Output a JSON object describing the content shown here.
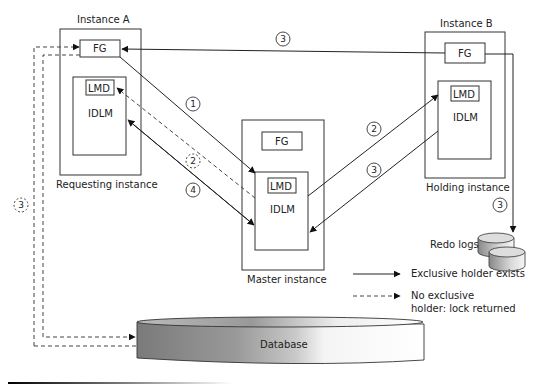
{
  "instances": {
    "a": {
      "title": "Instance A",
      "caption": "Requesting instance",
      "fg": "FG",
      "lmd": "LMD",
      "idlm": "IDLM"
    },
    "master": {
      "caption": "Master instance",
      "fg": "FG",
      "lmd": "LMD",
      "idlm": "IDLM"
    },
    "b": {
      "title": "Instance B",
      "caption": "Holding instance",
      "fg": "FG",
      "lmd": "LMD",
      "idlm": "IDLM"
    }
  },
  "steps": {
    "s1": "1",
    "s2_dashed": "2",
    "s4": "4",
    "s2_to_b": "2",
    "s3_b_to_master": "3",
    "s3_top": "3",
    "s3_redo": "3",
    "s3_left_dashed": "3"
  },
  "storage": {
    "redo_logs": "Redo logs",
    "database": "Database"
  },
  "legend": {
    "solid": "Exclusive holder exists",
    "dashed_line1": "No exclusive",
    "dashed_line2": "holder: lock returned"
  }
}
